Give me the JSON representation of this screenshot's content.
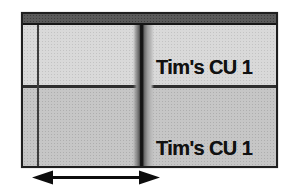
{
  "figure": {
    "panel": {
      "header": {
        "color": "#5a5a5a"
      },
      "tracks": [
        {
          "label": "Tim's CU 1",
          "bg_color": "#d9d9d9"
        },
        {
          "label": "Tim's CU 1",
          "bg_color": "#c6c6c6"
        }
      ],
      "playhead": {
        "core_color": "#141414",
        "glow_color": "#8c8c8c"
      },
      "grid_line_color": "#3c3c3c",
      "border_color": "#1f1f1f"
    },
    "annotation_arrow": {
      "direction": "horizontal-double-headed",
      "color": "#0d0d0d"
    }
  }
}
